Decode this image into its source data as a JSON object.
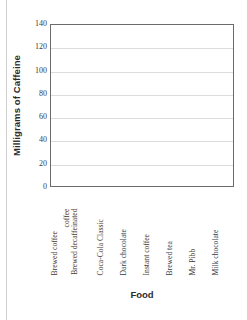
{
  "chart_data": {
    "type": "bar",
    "title": "",
    "xlabel": "Food",
    "ylabel": "Milligrams of Caffeine",
    "categories": [
      "Brewed coffee",
      "Brewed decaffeinated coffee",
      "Coca-Cola Classic",
      "Dark chocolate",
      "Instant coffee",
      "Brewed tea",
      "Mr. Pibb",
      "Milk chocolate"
    ],
    "values": [
      null,
      null,
      null,
      null,
      null,
      null,
      null,
      null
    ],
    "ylim": [
      0,
      140
    ],
    "ytick_step": 20,
    "yticks": [
      140,
      120,
      100,
      80,
      60,
      40,
      20,
      0
    ],
    "ytick_labels": [
      "140",
      "120",
      "100",
      "80",
      "60",
      "40",
      "20",
      "0"
    ],
    "grid": true,
    "grid_axis": "y",
    "legend": false,
    "legend_position": "none",
    "bars_drawn": false,
    "note": "Blank bar-chart template: axes, gridlines and labels only; no bars plotted."
  },
  "axis": {
    "y_title": "Milligrams of Caffeine",
    "x_title": "Food"
  },
  "category_label_lines": [
    [
      "Brewed coffee"
    ],
    [
      "Brewed decaffeinated",
      "coffee"
    ],
    [
      "Coca-Cola Classic"
    ],
    [
      "Dark chocolate"
    ],
    [
      "Instant coffee"
    ],
    [
      "Brewed tea"
    ],
    [
      "Mr. Pibb"
    ],
    [
      "Milk chocolate"
    ]
  ],
  "colors": {
    "plot_frame": "#6b6b6b",
    "gridline": "#dcdcdc",
    "text": "#3a3a3a",
    "title_text": "#2b2b2b",
    "background": "#ffffff",
    "bar_fill": "#7f7f7f",
    "page_edge_rule": "#cfcfcf"
  }
}
